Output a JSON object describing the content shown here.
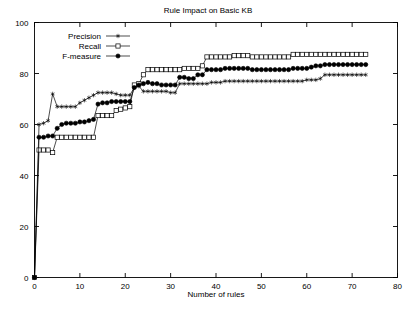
{
  "chart_data": {
    "type": "line",
    "title": "Rule Impact on Basic KB",
    "xlabel": "Number of rules",
    "ylabel": "",
    "xlim": [
      0,
      80
    ],
    "ylim": [
      0,
      100
    ],
    "xticks": [
      0,
      10,
      20,
      30,
      40,
      50,
      60,
      70,
      80
    ],
    "yticks": [
      0,
      20,
      40,
      60,
      80,
      100
    ],
    "grid": false,
    "legend_position": "top-left-inside",
    "x": [
      0,
      1,
      2,
      3,
      4,
      5,
      6,
      7,
      8,
      9,
      10,
      11,
      12,
      13,
      14,
      15,
      16,
      17,
      18,
      19,
      20,
      21,
      22,
      23,
      24,
      25,
      26,
      27,
      28,
      29,
      30,
      31,
      32,
      33,
      34,
      35,
      36,
      37,
      38,
      39,
      40,
      41,
      42,
      43,
      44,
      45,
      46,
      47,
      48,
      49,
      50,
      51,
      52,
      53,
      54,
      55,
      56,
      57,
      58,
      59,
      60,
      61,
      62,
      63,
      64,
      65,
      66,
      67,
      68,
      69,
      70,
      71,
      72,
      73
    ],
    "series": [
      {
        "name": "Precision",
        "marker": "star",
        "values": [
          0,
          60.0,
          60.5,
          61.5,
          72.0,
          67.0,
          67.0,
          67.0,
          67.0,
          67.0,
          68.5,
          69.5,
          70.5,
          71.5,
          72.5,
          72.5,
          72.5,
          72.5,
          72.0,
          71.5,
          71.5,
          71.5,
          74.5,
          75.0,
          73.0,
          73.0,
          73.0,
          73.0,
          73.0,
          73.0,
          72.5,
          72.5,
          76.0,
          76.0,
          76.0,
          76.0,
          76.0,
          76.0,
          76.0,
          76.5,
          76.5,
          76.5,
          77.0,
          77.0,
          77.0,
          77.0,
          77.0,
          77.0,
          77.0,
          77.0,
          77.0,
          77.0,
          77.0,
          77.0,
          77.0,
          77.0,
          77.0,
          77.0,
          77.0,
          77.0,
          77.5,
          77.5,
          77.5,
          78.0,
          79.5,
          79.5,
          79.5,
          79.5,
          79.5,
          79.5,
          79.5,
          79.5,
          79.5,
          79.5
        ]
      },
      {
        "name": "Recall",
        "marker": "open-square",
        "values": [
          0,
          50.0,
          50.0,
          50.0,
          49.0,
          55.0,
          55.0,
          55.0,
          55.0,
          55.0,
          55.0,
          55.0,
          55.0,
          55.0,
          63.5,
          63.5,
          63.5,
          63.5,
          65.5,
          66.0,
          66.5,
          67.0,
          75.5,
          76.0,
          79.5,
          81.5,
          81.5,
          81.5,
          81.5,
          81.5,
          81.5,
          81.5,
          81.5,
          82.0,
          82.0,
          82.0,
          82.0,
          83.0,
          86.5,
          86.5,
          86.5,
          86.5,
          86.5,
          86.5,
          87.0,
          87.0,
          87.0,
          87.0,
          86.5,
          86.5,
          86.5,
          86.5,
          86.5,
          86.5,
          86.5,
          86.5,
          86.5,
          87.5,
          87.5,
          87.5,
          87.5,
          87.5,
          87.5,
          87.5,
          87.5,
          87.5,
          87.5,
          87.5,
          87.5,
          87.5,
          87.5,
          87.5,
          87.5,
          87.5
        ]
      },
      {
        "name": "F-measure",
        "marker": "filled-circle",
        "values": [
          0,
          55.0,
          55.0,
          55.5,
          55.5,
          58.5,
          60.0,
          60.5,
          60.5,
          60.5,
          61.0,
          61.0,
          61.5,
          62.0,
          68.0,
          68.5,
          68.5,
          69.0,
          69.0,
          69.0,
          69.0,
          69.0,
          74.5,
          75.5,
          76.0,
          76.5,
          76.0,
          76.0,
          75.5,
          75.5,
          75.5,
          75.5,
          78.5,
          78.5,
          78.0,
          78.0,
          79.5,
          79.5,
          81.5,
          81.5,
          81.5,
          81.5,
          82.0,
          82.0,
          82.0,
          82.0,
          82.0,
          82.0,
          81.5,
          81.5,
          81.5,
          81.5,
          81.5,
          81.5,
          81.5,
          81.5,
          81.5,
          82.0,
          82.0,
          82.0,
          82.0,
          82.5,
          83.0,
          83.0,
          83.5,
          83.5,
          83.5,
          83.5,
          83.5,
          83.5,
          83.5,
          83.5,
          83.5,
          83.5
        ]
      }
    ]
  },
  "legend": {
    "items": [
      {
        "label": "Precision"
      },
      {
        "label": "Recall"
      },
      {
        "label": "F-measure"
      }
    ]
  },
  "axis": {
    "x_tick_labels": [
      "0",
      "10",
      "20",
      "30",
      "40",
      "50",
      "60",
      "70",
      "80"
    ],
    "y_tick_labels": [
      "0",
      "20",
      "40",
      "60",
      "80",
      "100"
    ]
  },
  "colors": {
    "foreground": "#000000",
    "background": "#ffffff"
  }
}
